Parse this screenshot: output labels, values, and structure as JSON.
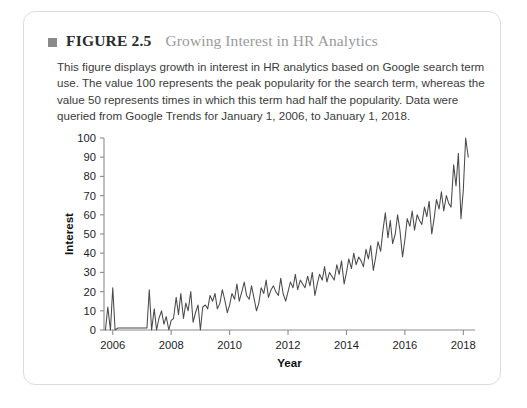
{
  "card": {
    "header": {
      "bullet_icon": "square-bullet-icon",
      "figure_number": "FIGURE 2.5",
      "figure_title": "Growing Interest in HR Analytics"
    },
    "caption": "This figure displays growth in interest in HR analytics based on Google search term use. The value 100 represents the peak popularity for the search term, whereas the value 50 represents times in which this term had half the popularity. Data were queried from Google Trends for January 1, 2006, to January 1, 2018."
  },
  "colors": {
    "card_border": "#dcdcdc",
    "bullet": "#8a8a8a",
    "figure_number_text": "#2b2b2b",
    "figure_title_text": "#9a9a9a",
    "caption_text": "#3b3b3b",
    "axis": "#8c8c8c",
    "line": "#4a4a4a"
  },
  "chart_data": {
    "type": "line",
    "title": "Growing Interest in HR Analytics",
    "xlabel": "Year",
    "ylabel": "Interest",
    "xlim": [
      2005.7,
      2018.4
    ],
    "ylim": [
      0,
      100
    ],
    "yticks": [
      0,
      10,
      20,
      30,
      40,
      50,
      60,
      70,
      80,
      90,
      100
    ],
    "xticks": [
      2006,
      2008,
      2010,
      2012,
      2014,
      2016,
      2018
    ],
    "grid": false,
    "legend": "none",
    "series": [
      {
        "name": "HR analytics search interest",
        "x": [
          2005.75,
          2005.83,
          2005.92,
          2006.0,
          2006.08,
          2006.17,
          2006.25,
          2006.33,
          2006.42,
          2006.5,
          2006.58,
          2006.67,
          2006.75,
          2006.83,
          2006.92,
          2007.0,
          2007.08,
          2007.17,
          2007.25,
          2007.33,
          2007.42,
          2007.5,
          2007.58,
          2007.67,
          2007.75,
          2007.83,
          2007.92,
          2008.0,
          2008.08,
          2008.17,
          2008.25,
          2008.33,
          2008.42,
          2008.5,
          2008.58,
          2008.67,
          2008.75,
          2008.83,
          2008.92,
          2009.0,
          2009.08,
          2009.17,
          2009.25,
          2009.33,
          2009.42,
          2009.5,
          2009.58,
          2009.67,
          2009.75,
          2009.83,
          2009.92,
          2010.0,
          2010.08,
          2010.17,
          2010.25,
          2010.33,
          2010.42,
          2010.5,
          2010.58,
          2010.67,
          2010.75,
          2010.83,
          2010.92,
          2011.0,
          2011.08,
          2011.17,
          2011.25,
          2011.33,
          2011.42,
          2011.5,
          2011.58,
          2011.67,
          2011.75,
          2011.83,
          2011.92,
          2012.0,
          2012.08,
          2012.17,
          2012.25,
          2012.33,
          2012.42,
          2012.5,
          2012.58,
          2012.67,
          2012.75,
          2012.83,
          2012.92,
          2013.0,
          2013.08,
          2013.17,
          2013.25,
          2013.33,
          2013.42,
          2013.5,
          2013.58,
          2013.67,
          2013.75,
          2013.83,
          2013.92,
          2014.0,
          2014.08,
          2014.17,
          2014.25,
          2014.33,
          2014.42,
          2014.5,
          2014.58,
          2014.67,
          2014.75,
          2014.83,
          2014.92,
          2015.0,
          2015.08,
          2015.17,
          2015.25,
          2015.33,
          2015.42,
          2015.5,
          2015.58,
          2015.67,
          2015.75,
          2015.83,
          2015.92,
          2016.0,
          2016.08,
          2016.17,
          2016.25,
          2016.33,
          2016.42,
          2016.5,
          2016.58,
          2016.67,
          2016.75,
          2016.83,
          2016.92,
          2017.0,
          2017.08,
          2017.17,
          2017.25,
          2017.33,
          2017.42,
          2017.5,
          2017.58,
          2017.67,
          2017.75,
          2017.83,
          2017.92,
          2018.0,
          2018.08,
          2018.17
        ],
        "values": [
          0,
          12,
          0,
          22,
          0,
          1,
          1,
          1,
          1,
          1,
          1,
          1,
          1,
          1,
          1,
          1,
          1,
          1,
          21,
          0,
          11,
          0,
          6,
          10,
          3,
          7,
          0,
          5,
          6,
          17,
          8,
          19,
          6,
          14,
          10,
          20,
          4,
          9,
          13,
          0,
          12,
          13,
          11,
          18,
          15,
          19,
          11,
          14,
          21,
          16,
          9,
          13,
          19,
          16,
          24,
          15,
          20,
          25,
          18,
          16,
          23,
          17,
          10,
          14,
          22,
          19,
          26,
          17,
          21,
          23,
          20,
          18,
          27,
          19,
          15,
          20,
          25,
          22,
          29,
          21,
          26,
          24,
          22,
          28,
          23,
          30,
          18,
          24,
          29,
          26,
          33,
          25,
          30,
          28,
          26,
          34,
          29,
          36,
          24,
          30,
          37,
          32,
          40,
          34,
          38,
          36,
          33,
          42,
          37,
          44,
          31,
          38,
          46,
          41,
          52,
          61,
          48,
          57,
          45,
          50,
          60,
          52,
          38,
          47,
          58,
          54,
          62,
          52,
          60,
          57,
          55,
          64,
          59,
          67,
          50,
          58,
          68,
          63,
          72,
          62,
          70,
          66,
          64,
          86,
          75,
          92,
          58,
          73,
          100,
          90
        ]
      }
    ]
  }
}
